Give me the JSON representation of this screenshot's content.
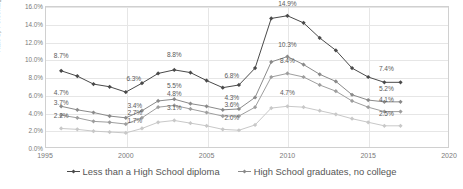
{
  "chart_data": {
    "type": "line",
    "title": "",
    "xlabel": "",
    "ylabel": "Rate by Percentage",
    "xlim": [
      1995,
      2020
    ],
    "ylim": [
      0.0,
      16.0
    ],
    "grid": true,
    "legend_position": "bottom",
    "x_ticks": [
      "1995",
      "2000",
      "2005",
      "2010",
      "2015",
      "2020"
    ],
    "y_ticks": [
      "0.0%",
      "2.0%",
      "4.0%",
      "6.0%",
      "8.0%",
      "10.0%",
      "12.0%",
      "14.0%",
      "16.0%"
    ],
    "x": [
      1996,
      1997,
      1998,
      1999,
      2000,
      2001,
      2002,
      2003,
      2004,
      2005,
      2006,
      2007,
      2008,
      2009,
      2010,
      2011,
      2012,
      2013,
      2014,
      2015,
      2016,
      2017
    ],
    "series": [
      {
        "name": "Less than a High School diploma",
        "color": "#4a4a4a",
        "values": [
          8.7,
          8.1,
          7.2,
          6.9,
          6.3,
          7.3,
          8.4,
          8.8,
          8.5,
          7.6,
          6.8,
          7.1,
          9.0,
          14.6,
          14.9,
          14.1,
          12.4,
          11.0,
          9.0,
          8.0,
          7.4,
          7.4
        ]
      },
      {
        "name": "High School graduates, no college",
        "color": "#8a8a8a",
        "values": [
          4.7,
          4.3,
          4.0,
          3.6,
          3.4,
          4.2,
          5.3,
          5.5,
          5.0,
          4.7,
          4.3,
          4.4,
          5.7,
          9.7,
          10.3,
          9.4,
          8.3,
          7.5,
          6.0,
          5.4,
          5.2,
          5.2
        ]
      },
      {
        "name": "Some college or associate degree",
        "color": "#9e9e9e",
        "values": [
          3.7,
          3.4,
          3.0,
          2.9,
          2.7,
          3.4,
          4.6,
          4.8,
          4.4,
          4.0,
          3.6,
          3.6,
          4.6,
          8.0,
          8.4,
          8.0,
          7.1,
          6.4,
          5.3,
          4.6,
          4.1,
          4.1
        ]
      },
      {
        "name": "Bachelor's degree and higher",
        "color": "#c8c8c8",
        "values": [
          2.2,
          2.1,
          1.9,
          1.8,
          1.7,
          2.2,
          2.9,
          3.1,
          2.8,
          2.5,
          2.1,
          2.0,
          2.6,
          4.5,
          4.7,
          4.6,
          4.2,
          3.8,
          3.3,
          2.9,
          2.5,
          2.5
        ]
      }
    ],
    "point_labels": [
      {
        "text": "8.7%",
        "x": 1996,
        "y": 8.7,
        "dx": 0,
        "dy": 16
      },
      {
        "text": "6.3%",
        "x": 2000,
        "y": 6.3,
        "dx": 8,
        "dy": 14
      },
      {
        "text": "8.8%",
        "x": 2003,
        "y": 8.8,
        "dx": 0,
        "dy": 16
      },
      {
        "text": "6.8%",
        "x": 2006,
        "y": 6.8,
        "dx": 9,
        "dy": 13
      },
      {
        "text": "14.9%",
        "x": 2010,
        "y": 14.9,
        "dx": 0,
        "dy": 13
      },
      {
        "text": "7.4%",
        "x": 2016,
        "y": 7.4,
        "dx": 2,
        "dy": 14
      },
      {
        "text": "4.7%",
        "x": 1996,
        "y": 4.7,
        "dx": 0,
        "dy": 14
      },
      {
        "text": "3.4%",
        "x": 2000,
        "y": 3.4,
        "dx": 9,
        "dy": 13
      },
      {
        "text": "5.5%",
        "x": 2003,
        "y": 5.5,
        "dx": 0,
        "dy": 14
      },
      {
        "text": "4.3%",
        "x": 2006,
        "y": 4.3,
        "dx": 9,
        "dy": 13
      },
      {
        "text": "10.3%",
        "x": 2010,
        "y": 10.3,
        "dx": 0,
        "dy": 13
      },
      {
        "text": "5.2%",
        "x": 2016,
        "y": 5.2,
        "dx": 2,
        "dy": 14
      },
      {
        "text": "3.7%",
        "x": 1996,
        "y": 3.7,
        "dx": 0,
        "dy": 13
      },
      {
        "text": "2.7%",
        "x": 2000,
        "y": 2.7,
        "dx": 9,
        "dy": 12
      },
      {
        "text": "4.8%",
        "x": 2003,
        "y": 4.8,
        "dx": 0,
        "dy": 12
      },
      {
        "text": "3.6%",
        "x": 2006,
        "y": 3.6,
        "dx": 9,
        "dy": 12
      },
      {
        "text": "8.4%",
        "x": 2010,
        "y": 8.4,
        "dx": 0,
        "dy": 13
      },
      {
        "text": "4.1%",
        "x": 2016,
        "y": 4.1,
        "dx": 2,
        "dy": 13
      },
      {
        "text": "2.2%",
        "x": 1996,
        "y": 2.2,
        "dx": 0,
        "dy": 13
      },
      {
        "text": "1.7%",
        "x": 2000,
        "y": 1.7,
        "dx": 9,
        "dy": 13
      },
      {
        "text": "3.1%",
        "x": 2003,
        "y": 3.1,
        "dx": 0,
        "dy": 13
      },
      {
        "text": "2.0%",
        "x": 2006,
        "y": 2.0,
        "dx": 9,
        "dy": 13
      },
      {
        "text": "4.7%",
        "x": 2010,
        "y": 4.7,
        "dx": 0,
        "dy": 14
      },
      {
        "text": "2.5%",
        "x": 2016,
        "y": 2.5,
        "dx": 2,
        "dy": 13
      }
    ]
  },
  "legend": {
    "items": [
      {
        "label": "Less than a High School diploma",
        "color": "#4a4a4a"
      },
      {
        "label": "High School graduates, no college",
        "color": "#8a8a8a"
      }
    ]
  }
}
